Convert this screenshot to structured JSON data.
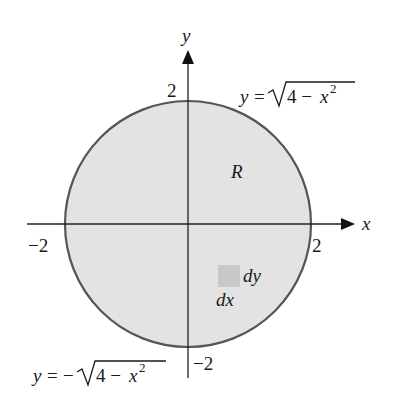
{
  "diagram": {
    "type": "region-of-integration",
    "region": {
      "label": "R",
      "shape": "disk",
      "radius": 2,
      "fill_color": "#e3e3e3",
      "boundary_color": "#555555"
    },
    "axes": {
      "x_label": "x",
      "y_label": "y",
      "x_ticks": [
        "-2",
        "2"
      ],
      "y_ticks": [
        "2",
        "-2"
      ]
    },
    "curves": {
      "upper": {
        "lhs": "y = ",
        "radicand": "4 − x",
        "exponent": "2",
        "sign": ""
      },
      "lower": {
        "lhs": "y = −",
        "radicand": "4 − x",
        "exponent": "2",
        "sign": "−"
      }
    },
    "element": {
      "dy_label": "dy",
      "dx_label": "dx",
      "fill_color": "#c8c8c8"
    },
    "tick_labels": {
      "neg_x": "−2",
      "pos_x": "2",
      "pos_y": "2",
      "neg_y": "−2"
    }
  }
}
